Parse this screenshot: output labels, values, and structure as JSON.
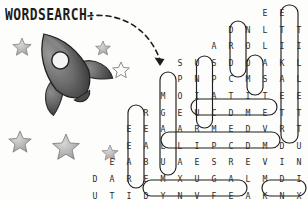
{
  "page": {
    "title_label": "WORDSEARCH:",
    "background_color": "#fdfdfb",
    "ink_color": "#2b2b2b"
  },
  "illustration": {
    "rocket": {
      "name": "rocket-sketch",
      "description": "pencil sketch rocket with fins and porthole"
    },
    "stars": [
      {
        "x": 22,
        "y": 46,
        "size": 9
      },
      {
        "x": 103,
        "y": 47,
        "size": 7
      },
      {
        "x": 121,
        "y": 70,
        "size": 8
      },
      {
        "x": 20,
        "y": 141,
        "size": 11
      },
      {
        "x": 66,
        "y": 147,
        "size": 13
      },
      {
        "x": 110,
        "y": 152,
        "size": 8
      }
    ],
    "arrow": {
      "name": "dashed-arrow",
      "from": [
        88,
        16
      ],
      "to": [
        162,
        66
      ]
    }
  },
  "wordsearch": {
    "cell_width": 17.0,
    "cell_height": 16.6,
    "origin_x": 129.0,
    "origin_y": 7.0,
    "rows": [
      {
        "start_col": 8,
        "letters": [
          "E",
          "E"
        ]
      },
      {
        "start_col": 6,
        "letters": [
          "D",
          "N",
          "L",
          "T",
          "T"
        ]
      },
      {
        "start_col": 5,
        "letters": [
          "A",
          "R",
          "O",
          "L",
          "I",
          "I"
        ]
      },
      {
        "start_col": 3,
        "letters": [
          "S",
          "U",
          "S",
          "D",
          "O",
          "A",
          "K",
          "L"
        ]
      },
      {
        "start_col": 3,
        "letters": [
          "P",
          "N",
          "P",
          "C",
          "M",
          "S",
          "A",
          "L"
        ]
      },
      {
        "start_col": 2,
        "letters": [
          "M",
          "O",
          "I",
          "A",
          "T",
          "I",
          "T",
          "E",
          "E"
        ]
      },
      {
        "start_col": 1,
        "letters": [
          "R",
          "G",
          "E",
          "U",
          "C",
          "D",
          "M",
          "E",
          "T",
          "T"
        ]
      },
      {
        "start_col": 0,
        "letters": [
          "E",
          "E",
          "A",
          "A",
          "R",
          "M",
          "E",
          "D",
          "V",
          "R",
          "T",
          "A"
        ]
      },
      {
        "start_col": 0,
        "letters": [
          "E",
          "A",
          "L",
          "L",
          "I",
          "P",
          "C",
          "D",
          "M",
          "D",
          "U",
          "S"
        ]
      },
      {
        "start_col": -1,
        "letters": [
          "E",
          "A",
          "B",
          "U",
          "A",
          "E",
          "S",
          "R",
          "E",
          "V",
          "I",
          "N",
          "U"
        ]
      },
      {
        "start_col": -2,
        "letters": [
          "D",
          "A",
          "R",
          "E",
          "M",
          "X",
          "U",
          "G",
          "A",
          "L",
          "M",
          "D",
          "I",
          "M"
        ]
      },
      {
        "start_col": -2,
        "letters": [
          "U",
          "T",
          "I",
          "D",
          "Y",
          "N",
          "V",
          "F",
          "E",
          "A",
          "K",
          "N",
          "X"
        ]
      },
      {
        "start_col": -3,
        "letters": [
          "F",
          "H",
          "R",
          "D",
          "C",
          "K",
          "E",
          "T",
          "U",
          "C",
          "S",
          "U",
          "N"
        ]
      }
    ],
    "found_words": [
      {
        "word": "SPACE",
        "direction": "vertical",
        "reversed": false
      },
      {
        "word": "MOON",
        "direction": "vertical",
        "reversed": true
      },
      {
        "word": "COMET",
        "direction": "horizontal",
        "reversed": false
      },
      {
        "word": "SATELLITE",
        "direction": "vertical",
        "reversed": false
      },
      {
        "word": "GALAXY",
        "direction": "vertical",
        "reversed": false
      },
      {
        "word": "EARTH",
        "direction": "vertical",
        "reversed": false
      },
      {
        "word": "UNIVERSE",
        "direction": "horizontal",
        "reversed": true
      },
      {
        "word": "ROCKET",
        "direction": "horizontal",
        "reversed": false
      },
      {
        "word": "SUN",
        "direction": "horizontal",
        "reversed": false
      }
    ],
    "circles": [
      {
        "label": "circle-space",
        "x": 196.5,
        "y": 56,
        "w": 16,
        "h": 72,
        "r": 8
      },
      {
        "label": "circle-moon",
        "x": 230,
        "y": 21,
        "w": 16,
        "h": 56,
        "r": 8
      },
      {
        "label": "circle-satellite",
        "x": 281,
        "y": 5,
        "w": 17,
        "h": 138,
        "r": 8
      },
      {
        "label": "circle-altitude",
        "x": 247,
        "y": 55,
        "w": 16,
        "h": 40,
        "r": 8
      },
      {
        "label": "circle-galaxy",
        "x": 160,
        "y": 72,
        "w": 16,
        "h": 103,
        "r": 8
      },
      {
        "label": "circle-earth",
        "x": 128,
        "y": 105,
        "w": 16,
        "h": 83,
        "r": 8
      },
      {
        "label": "circle-comet",
        "x": 191,
        "y": 99,
        "w": 86,
        "h": 16,
        "r": 8
      },
      {
        "label": "circle-universe",
        "x": 161,
        "y": 132,
        "w": 119,
        "h": 16,
        "r": 8
      },
      {
        "label": "circle-rocket",
        "x": 143,
        "y": 180,
        "w": 104,
        "h": 16,
        "r": 8
      },
      {
        "label": "circle-sun",
        "x": 262,
        "y": 180,
        "w": 44,
        "h": 16,
        "r": 8
      }
    ]
  }
}
